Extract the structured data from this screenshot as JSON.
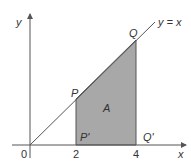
{
  "diagram": {
    "axes": {
      "x_label": "x",
      "y_label": "y",
      "origin_label": "0"
    },
    "line_label": "y = x",
    "ticks": [
      {
        "value": "2"
      },
      {
        "value": "4"
      }
    ],
    "points": {
      "P": "P",
      "Q": "Q",
      "P_prime": "P'",
      "Q_prime": "Q'"
    },
    "region_label": "A",
    "colors": {
      "region_fill": "#a8a8a8",
      "stroke": "#555555"
    }
  }
}
